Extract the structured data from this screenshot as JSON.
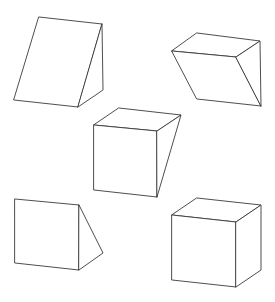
{
  "figure": {
    "width": 275,
    "height": 302,
    "background": "#ffffff",
    "stroke_color": "#3a3a3a",
    "shapes": [
      {
        "id": "wedge-top-left",
        "kind": "triangular-prism",
        "faces": [
          [
            [
              39,
              17
            ],
            [
              102,
              24
            ],
            [
              78,
              107
            ],
            [
              14,
              100
            ]
          ],
          [
            [
              102,
              24
            ],
            [
              103,
              90
            ],
            [
              78,
              107
            ]
          ]
        ]
      },
      {
        "id": "prism-top-right",
        "kind": "slanted-prism",
        "faces": [
          [
            [
              197,
              33
            ],
            [
              260,
              41
            ],
            [
              236,
              57
            ],
            [
              172,
              51
            ]
          ],
          [
            [
              172,
              51
            ],
            [
              236,
              57
            ],
            [
              261,
              106
            ],
            [
              197,
              99
            ]
          ],
          [
            [
              236,
              57
            ],
            [
              260,
              41
            ],
            [
              261,
              106
            ]
          ]
        ]
      },
      {
        "id": "prism-middle",
        "kind": "tapered-box",
        "faces": [
          [
            [
              119,
              108
            ],
            [
              181,
              115
            ],
            [
              157,
              131
            ],
            [
              94,
              125
            ]
          ],
          [
            [
              94,
              125
            ],
            [
              157,
              131
            ],
            [
              157,
              197
            ],
            [
              94,
              190
            ]
          ],
          [
            [
              157,
              131
            ],
            [
              181,
              115
            ],
            [
              157,
              197
            ]
          ]
        ]
      },
      {
        "id": "wedge-bottom-left",
        "kind": "triangular-prism",
        "faces": [
          [
            [
              15,
              199
            ],
            [
              79,
              205
            ],
            [
              79,
              270
            ],
            [
              15,
              263
            ]
          ],
          [
            [
              79,
              205
            ],
            [
              103,
              253
            ],
            [
              79,
              270
            ]
          ]
        ]
      },
      {
        "id": "cube-bottom-right",
        "kind": "cube",
        "faces": [
          [
            [
              197,
              198
            ],
            [
              261,
              205
            ],
            [
              236,
              222
            ],
            [
              172,
              215
            ]
          ],
          [
            [
              172,
              215
            ],
            [
              236,
              222
            ],
            [
              236,
              287
            ],
            [
              172,
              280
            ]
          ],
          [
            [
              236,
              222
            ],
            [
              261,
              205
            ],
            [
              261,
              270
            ],
            [
              236,
              287
            ]
          ]
        ]
      }
    ]
  }
}
